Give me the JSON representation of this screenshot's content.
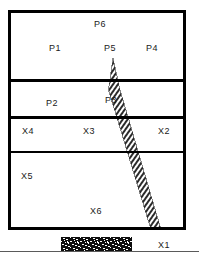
{
  "figure": {
    "type": "geological-cross-section-diagram",
    "background_color": "#ffffff",
    "line_color": "#000000",
    "text_color": "#1a1a1a"
  },
  "frame": {
    "name": "outer-boundary",
    "x": 8,
    "y": 10,
    "width": 178,
    "height": 220,
    "stroke_width": 3
  },
  "dividers": [
    {
      "name": "divider-p-upper",
      "y": 80,
      "x1": 10,
      "x2": 184,
      "stroke_width": 3
    },
    {
      "name": "divider-p-lower",
      "y": 117,
      "x1": 10,
      "x2": 184,
      "stroke_width": 3
    },
    {
      "name": "divider-x-middle",
      "y": 152,
      "x1": 10,
      "x2": 184,
      "stroke_width": 1.6
    }
  ],
  "fault_band": {
    "name": "hatched-fault-band",
    "pattern": "diagonal-hatch",
    "tip_x": 113,
    "tip_y": 58,
    "bottom_x": 157,
    "bottom_y": 228,
    "max_width": 10
  },
  "foundation": {
    "name": "stippled-foundation-block",
    "x": 61,
    "y": 237,
    "width": 71,
    "height": 15,
    "pattern": "stipple-speckle",
    "fill": "#0d0d0d"
  },
  "ground_line": {
    "name": "ground-reference-line",
    "y": 251,
    "x1": 0,
    "x2": 199,
    "stroke_width": 1
  },
  "labels": {
    "p6": "P6",
    "p1": "P1",
    "p5": "P5",
    "p4": "P4",
    "p2": "P2",
    "p3": "P3",
    "x4": "X4",
    "x3": "X3",
    "x2": "X2",
    "x5": "X5",
    "x6": "X6",
    "x1": "X1"
  }
}
